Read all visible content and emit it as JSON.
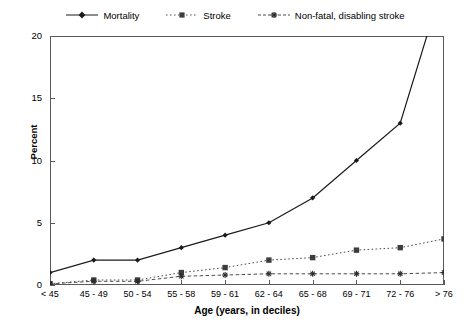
{
  "chart_data": {
    "type": "line",
    "title": "",
    "xlabel": "Age (years, in deciles)",
    "ylabel": "Percent",
    "categories": [
      "< 45",
      "45 - 49",
      "50 - 54",
      "55 - 58",
      "59 - 61",
      "62 - 64",
      "65 - 68",
      "69 - 71",
      "72 - 76",
      "> 76"
    ],
    "ylim": [
      0,
      20
    ],
    "yticks": [
      0,
      5,
      10,
      15,
      20
    ],
    "ytick_labels": [
      "0",
      "5",
      "10",
      "15",
      "20"
    ],
    "grid": false,
    "legend_position": "top-center",
    "series": [
      {
        "name": "Mortality",
        "marker": "diamond",
        "line_style": "solid",
        "color": "#1a1a1a",
        "values": [
          1.0,
          2.0,
          2.0,
          3.0,
          4.0,
          5.0,
          7.0,
          10.0,
          13.0,
          24.5
        ],
        "clipped_last_point": true
      },
      {
        "name": "Stroke",
        "marker": "square",
        "line_style": "dotted",
        "color": "#4d4d4d",
        "values": [
          0.1,
          0.4,
          0.4,
          1.0,
          1.4,
          2.0,
          2.2,
          2.8,
          3.0,
          3.7
        ]
      },
      {
        "name": "Non-fatal, disabling stroke",
        "marker": "asterisk",
        "line_style": "dashed",
        "color": "#4d4d4d",
        "values": [
          0.1,
          0.3,
          0.3,
          0.7,
          0.8,
          0.9,
          0.9,
          0.9,
          0.9,
          1.0
        ]
      }
    ]
  },
  "legend": {
    "items": [
      {
        "label": "Mortality",
        "icon": "solid-line-diamond-marker-icon"
      },
      {
        "label": "Stroke",
        "icon": "dotted-line-square-marker-icon"
      },
      {
        "label": "Non-fatal, disabling stroke",
        "icon": "dashed-line-asterisk-marker-icon"
      }
    ]
  },
  "colors": {
    "axis": "#5a5a5a",
    "mortality": "#1a1a1a",
    "stroke": "#4d4d4d",
    "nonfatal": "#4d4d4d",
    "background": "#ffffff"
  }
}
